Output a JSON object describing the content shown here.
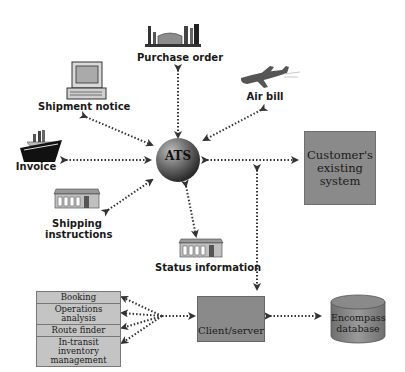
{
  "diagram": {
    "center": {
      "label": "ATS"
    },
    "nodes": {
      "purchase_order": {
        "label": "Purchase order",
        "icon": "factory-icon"
      },
      "shipment_notice": {
        "label": "Shipment notice",
        "icon": "computer-icon"
      },
      "air_bill": {
        "label": "Air bill",
        "icon": "airplane-icon"
      },
      "invoice": {
        "label": "Invoice",
        "icon": "ship-icon"
      },
      "shipping_instructions": {
        "label_line1": "Shipping",
        "label_line2": "instructions",
        "icon": "warehouse-icon"
      },
      "status_information": {
        "label": "Status information",
        "icon": "warehouse-icon"
      },
      "customer_system": {
        "line1": "Customer's",
        "line2": "existing",
        "line3": "system"
      },
      "client_server": {
        "label": "Client/server"
      },
      "encompass_db": {
        "line1": "Encompass",
        "line2": "database"
      }
    },
    "modules": [
      {
        "line1": "Booking",
        "line2": ""
      },
      {
        "line1": "Operations",
        "line2": "analysis"
      },
      {
        "line1": "Route finder",
        "line2": ""
      },
      {
        "line1": "In-transit inventory",
        "line2": "management"
      }
    ],
    "colors": {
      "box_gray": "#8a8a8a",
      "module_gray": "#c4c4c4",
      "sphere_dark": "#3a3a3a",
      "arrow": "#333333"
    }
  }
}
